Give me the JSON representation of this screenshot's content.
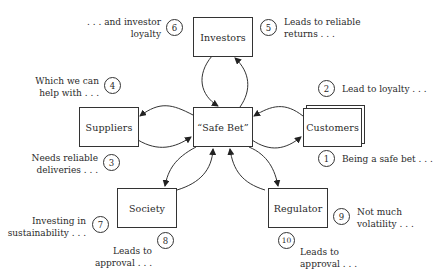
{
  "diagram": {
    "nodes": [
      {
        "id": "investors",
        "label": "Investors"
      },
      {
        "id": "safe_bet",
        "label": "“Safe Bet”"
      },
      {
        "id": "suppliers",
        "label": "Suppliers"
      },
      {
        "id": "customers",
        "label": "Customers"
      },
      {
        "id": "society",
        "label": "Society"
      },
      {
        "id": "regulator",
        "label": "Regulator"
      }
    ],
    "edges": [
      {
        "from": "safe_bet",
        "to": "investors"
      },
      {
        "from": "investors",
        "to": "safe_bet"
      },
      {
        "from": "safe_bet",
        "to": "suppliers"
      },
      {
        "from": "suppliers",
        "to": "safe_bet"
      },
      {
        "from": "safe_bet",
        "to": "customers"
      },
      {
        "from": "customers",
        "to": "safe_bet"
      },
      {
        "from": "safe_bet",
        "to": "society"
      },
      {
        "from": "society",
        "to": "safe_bet"
      },
      {
        "from": "safe_bet",
        "to": "regulator"
      },
      {
        "from": "regulator",
        "to": "safe_bet"
      }
    ],
    "annotations": [
      {
        "number": "1",
        "text": "Being a safe bet . . ."
      },
      {
        "number": "2",
        "text": "Lead to loyalty . . ."
      },
      {
        "number": "3",
        "text": "Needs reliable\ndeliveries . . ."
      },
      {
        "number": "4",
        "text": "Which we can\nhelp with . . ."
      },
      {
        "number": "5",
        "text": "Leads to reliable\nreturns . . ."
      },
      {
        "number": "6",
        "text": ". . . and investor\nloyalty"
      },
      {
        "number": "7",
        "text": "Investing in\nsustainability . . ."
      },
      {
        "number": "8",
        "text": "Leads to\napproval . . ."
      },
      {
        "number": "9",
        "text": "Not much\nvolatility . . ."
      },
      {
        "number": "10",
        "text": "Leads to\napproval . . ."
      }
    ]
  }
}
